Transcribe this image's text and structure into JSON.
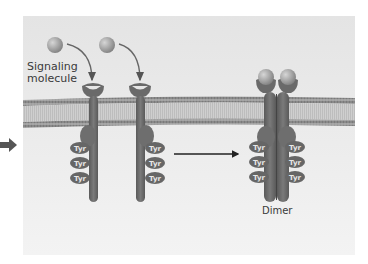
{
  "figure": {
    "labels": {
      "signaling_molecule_line1": "Signaling",
      "signaling_molecule_line2": "molecule",
      "dimer": "Dimer",
      "tyr": "Tyr"
    },
    "colors": {
      "panel_top": "#e6e6e6",
      "panel_bottom": "#f2f2f2",
      "membrane_head": "#8c8c8c",
      "membrane_core": "#c9c9c9",
      "receptor": "#6e6e6e",
      "receptor_dark": "#555555",
      "ligand": "#9a9a9a",
      "arrow": "#444444",
      "tyr_fill": "#666666"
    },
    "receptors": [
      {
        "id": "receptor-1",
        "stem_x": 93,
        "tyr_side": "left"
      },
      {
        "id": "receptor-2",
        "stem_x": 140,
        "tyr_side": "right"
      }
    ],
    "ligands": [
      {
        "id": "ligand-1",
        "x": 55,
        "y": 45
      },
      {
        "id": "ligand-2",
        "x": 107,
        "y": 45
      }
    ],
    "dimer": {
      "left_x": 270,
      "right_x": 283
    },
    "tyr_rows_y": [
      148,
      163,
      178
    ]
  }
}
